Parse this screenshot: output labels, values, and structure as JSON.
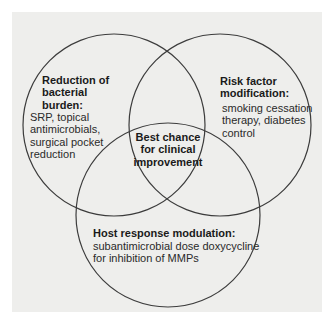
{
  "diagram": {
    "type": "venn",
    "colors": {
      "background": "#ffffff",
      "panel": "#eeeeec",
      "stroke": "#3c3c3c",
      "text": "#2a2a2a"
    },
    "sets": [
      {
        "id": "bacterial",
        "heading": [
          "Reduction of",
          "bacterial",
          "burden:"
        ],
        "body": [
          "SRP, topical",
          "antimicrobials,",
          "surgical pocket",
          "reduction"
        ]
      },
      {
        "id": "risk",
        "heading": [
          "Risk factor",
          "modification:"
        ],
        "body": [
          "smoking cessation",
          "therapy, diabetes",
          "control"
        ]
      },
      {
        "id": "host",
        "heading": [
          "Host response modulation:"
        ],
        "body": [
          "subantimicrobial dose doxycycline",
          "for inhibition of MMPs"
        ]
      }
    ],
    "intersection": {
      "label": [
        "Best chance",
        "for clinical",
        "improvement"
      ]
    }
  }
}
